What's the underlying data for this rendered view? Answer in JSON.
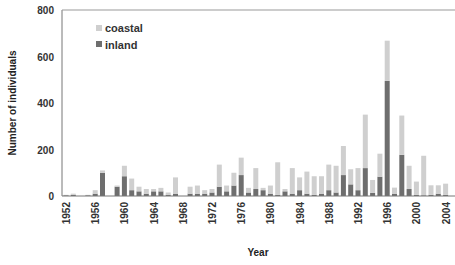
{
  "chart_data": {
    "type": "bar",
    "stacked": true,
    "title": "",
    "xlabel": "Year",
    "ylabel": "Number of individuals",
    "ylim": [
      0,
      800
    ],
    "yticks": [
      0,
      200,
      400,
      600,
      800
    ],
    "xticks": [
      1952,
      1956,
      1960,
      1964,
      1968,
      1972,
      1976,
      1980,
      1984,
      1988,
      1992,
      1996,
      2000,
      2004
    ],
    "legend_position": "top-left",
    "categories": [
      1952,
      1953,
      1954,
      1955,
      1956,
      1957,
      1958,
      1959,
      1960,
      1961,
      1962,
      1963,
      1964,
      1965,
      1966,
      1967,
      1968,
      1969,
      1970,
      1971,
      1972,
      1973,
      1974,
      1975,
      1976,
      1977,
      1978,
      1979,
      1980,
      1981,
      1982,
      1983,
      1984,
      1985,
      1986,
      1987,
      1988,
      1989,
      1990,
      1991,
      1992,
      1993,
      1994,
      1995,
      1996,
      1997,
      1998,
      1999,
      2000,
      2001,
      2002,
      2003,
      2004
    ],
    "series": [
      {
        "name": "inland",
        "color": "#6e6e6e",
        "values": [
          3,
          5,
          0,
          3,
          10,
          100,
          0,
          40,
          85,
          25,
          20,
          10,
          20,
          20,
          5,
          10,
          0,
          10,
          10,
          10,
          15,
          40,
          20,
          45,
          90,
          15,
          30,
          25,
          10,
          5,
          20,
          10,
          25,
          10,
          5,
          10,
          25,
          15,
          90,
          50,
          25,
          120,
          14,
          83,
          495,
          10,
          177,
          30,
          5,
          3,
          5,
          10,
          5
        ]
      },
      {
        "name": "coastal",
        "color": "#cfcfcf",
        "values": [
          2,
          5,
          0,
          2,
          15,
          10,
          0,
          5,
          45,
          50,
          20,
          20,
          10,
          15,
          10,
          70,
          0,
          30,
          35,
          15,
          15,
          95,
          25,
          55,
          75,
          20,
          90,
          10,
          35,
          140,
          10,
          110,
          55,
          95,
          80,
          75,
          110,
          115,
          125,
          65,
          95,
          230,
          55,
          99,
          173,
          26,
          169,
          100,
          57,
          170,
          41,
          36,
          48
        ]
      }
    ]
  }
}
